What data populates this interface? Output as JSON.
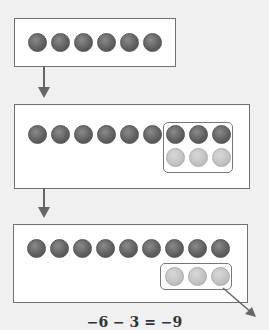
{
  "steps": [
    {
      "dark_chips": 6,
      "light_chips": 0
    },
    {
      "dark_chips": 9,
      "light_chips": 3,
      "grouped": "3 dark + 3 light (zero pairs added)"
    },
    {
      "dark_chips": 9,
      "light_chips": 3,
      "grouped": "3 light removed"
    }
  ],
  "equation": "−6 − 3 = −9",
  "colors": {
    "dark_chip": "#5e5e5e",
    "light_chip": "#c2c2c2",
    "arrow": "#666666"
  }
}
